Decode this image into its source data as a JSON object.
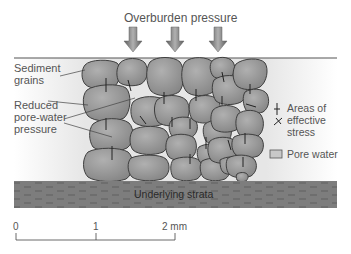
{
  "title": "Overburden pressure",
  "labels": {
    "sediment_grains": [
      "Sediment",
      "grains"
    ],
    "reduced_pressure": [
      "Reduced",
      "pore-water",
      "pressure"
    ],
    "legend_stress": [
      "Areas of",
      "effective",
      "stress"
    ],
    "legend_pore_water": "Pore water",
    "strata": "Underlying strata"
  },
  "scale": {
    "ticks": [
      "0",
      "1",
      "2 mm"
    ]
  },
  "colors": {
    "grain_fill": "#9a9a9a",
    "grain_stroke": "#3f3f3f",
    "pore_water": "#e4e4e4",
    "strata": "#7d7d7d",
    "arrow": "#808080"
  }
}
